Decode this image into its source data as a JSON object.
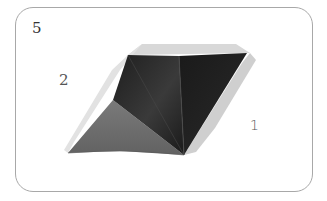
{
  "figure": {
    "step_number": "5",
    "labels": {
      "left": "2",
      "right": "1"
    },
    "colors": {
      "frame_border": "#a8a8a8",
      "face_dark": "#262626",
      "face_darker": "#1c1c1c",
      "face_gray": "#6e6e6e",
      "edge_light": "#d4d4d4",
      "edge_lighter": "#e6e6e6"
    }
  }
}
